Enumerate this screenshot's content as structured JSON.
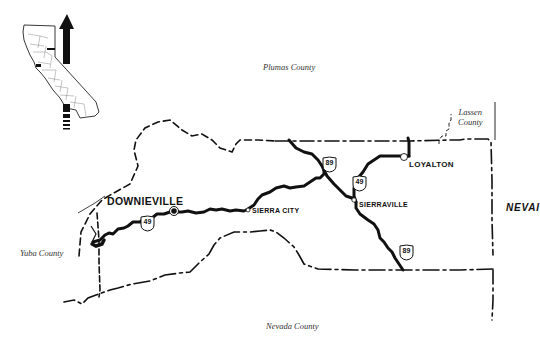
{
  "map": {
    "type": "county-map",
    "subject": "Sierra County, California",
    "colors": {
      "background": "#ffffff",
      "ink": "#111111",
      "label": "#333333"
    }
  },
  "counties": {
    "plumas": "Plumas County",
    "lassen_line1": "Lassen",
    "lassen_line2": "County",
    "yuba": "Yuba County",
    "nevada": "Nevada County"
  },
  "state": {
    "nevada": "NEVAI"
  },
  "towns": [
    {
      "name": "DOWNIEVILLE",
      "type": "county-seat"
    },
    {
      "name": "SIERRA CITY",
      "type": "town"
    },
    {
      "name": "SIERRAVILLE",
      "type": "town"
    },
    {
      "name": "LOYALTON",
      "type": "town"
    }
  ],
  "highways": [
    {
      "route": "49",
      "position": "west of Downieville"
    },
    {
      "route": "89",
      "position": "north, near Plumas line"
    },
    {
      "route": "49",
      "position": "north of Sierraville"
    },
    {
      "route": "89",
      "position": "south of Sierraville"
    }
  ],
  "inset": {
    "name": "california-locator-inset",
    "north_arrow": "north-arrow-icon"
  }
}
